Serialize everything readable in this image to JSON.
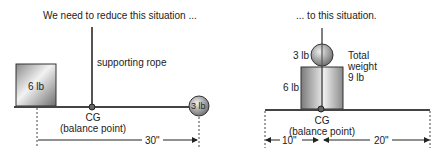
{
  "left": {
    "title": "We need to reduce this situation ...",
    "rope_label": "supporting rope",
    "box_label": "6 lb",
    "ball_label": "3 lb",
    "cg_label": "CG",
    "cg_sub": "(balance point)",
    "distance": "30\""
  },
  "right": {
    "title": "... to this situation.",
    "ball_label": "3 lb",
    "box_label": "6 lb",
    "total_line1": "Total",
    "total_line2": "weight",
    "total_line3": "9 lb",
    "cg_label": "CG",
    "cg_sub": "(balance point)",
    "distance_left": "10\"",
    "distance_right": "20\""
  }
}
